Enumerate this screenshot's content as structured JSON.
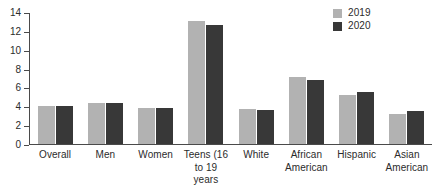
{
  "chart_data": {
    "type": "bar",
    "title": "",
    "subtitle": "",
    "xlabel": "",
    "ylabel": "",
    "ylim": [
      0,
      14
    ],
    "yticks": [
      0,
      2,
      4,
      6,
      8,
      10,
      12,
      14
    ],
    "ytick_labels": [
      "0",
      "2",
      "4",
      "6",
      "8",
      "10",
      "12",
      "14"
    ],
    "grid": false,
    "legend_position": "top-right",
    "categories": [
      "Overall",
      "Men",
      "Women",
      "Teens (16\nto 19\nyears",
      "White",
      "African\nAmerican",
      "Hispanic",
      "Asian\nAmerican"
    ],
    "series": [
      {
        "name": "2019",
        "color": "#b2b2b2",
        "values": [
          4.1,
          4.4,
          3.8,
          13.2,
          3.7,
          7.2,
          5.2,
          3.2
        ]
      },
      {
        "name": "2020",
        "color": "#383838",
        "values": [
          4.1,
          4.4,
          3.8,
          12.7,
          3.6,
          6.8,
          5.6,
          3.5
        ]
      }
    ]
  },
  "legend": {
    "items": [
      {
        "label": "2019",
        "color": "#b2b2b2"
      },
      {
        "label": "2020",
        "color": "#383838"
      }
    ]
  },
  "colors": {
    "axis": "#4a4a4a",
    "text": "#2b2b2b",
    "background": "#ffffff",
    "series_2019": "#b2b2b2",
    "series_2020": "#383838"
  }
}
